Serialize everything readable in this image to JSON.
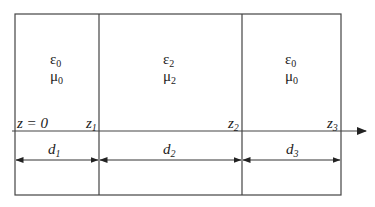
{
  "diagram": {
    "colors": {
      "line": "#333333",
      "text": "#222222",
      "background": "#ffffff"
    },
    "regions": [
      {
        "epsilon": "ε",
        "epsilon_sub": "0",
        "mu": "μ",
        "mu_sub": "0"
      },
      {
        "epsilon": "ε",
        "epsilon_sub": "2",
        "mu": "μ",
        "mu_sub": "2"
      },
      {
        "epsilon": "ε",
        "epsilon_sub": "0",
        "mu": "μ",
        "mu_sub": "0"
      }
    ],
    "axis": {
      "origin_label": "z = 0",
      "boundaries": [
        {
          "var": "z",
          "sub": "1"
        },
        {
          "var": "z",
          "sub": "2"
        },
        {
          "var": "z",
          "sub": "3"
        }
      ]
    },
    "dimensions": [
      {
        "var": "d",
        "sub": "1"
      },
      {
        "var": "d",
        "sub": "2"
      },
      {
        "var": "d",
        "sub": "3"
      }
    ]
  }
}
